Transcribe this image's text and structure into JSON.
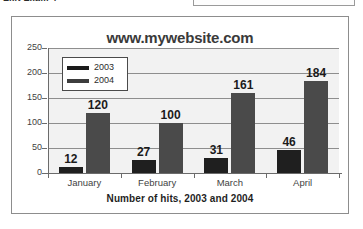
{
  "page": {
    "cut_heading_fragment": "Exit Exam 4"
  },
  "figure": {
    "title": "www.mywebsite.com",
    "axis_title": "Number of hits, 2003 and 2004"
  },
  "legend": {
    "entries": [
      {
        "label": "2003",
        "color": "#1b1b1b"
      },
      {
        "label": "2004",
        "color": "#3d3d3d"
      }
    ]
  },
  "chart_data": {
    "type": "bar",
    "title": "www.mywebsite.com",
    "xlabel": "Number of hits, 2003 and 2004",
    "ylabel": "",
    "categories": [
      "January",
      "February",
      "March",
      "April"
    ],
    "series": [
      {
        "name": "2003",
        "color": "#1f1f1f",
        "values": [
          12,
          27,
          31,
          46
        ]
      },
      {
        "name": "2004",
        "color": "#4a4a4a",
        "values": [
          120,
          100,
          161,
          184
        ]
      }
    ],
    "ylim": [
      0,
      250
    ],
    "yticks": [
      0,
      50,
      100,
      150,
      200,
      250
    ],
    "grid": true,
    "data_labels": true,
    "legend_position": "inside-top-left"
  }
}
